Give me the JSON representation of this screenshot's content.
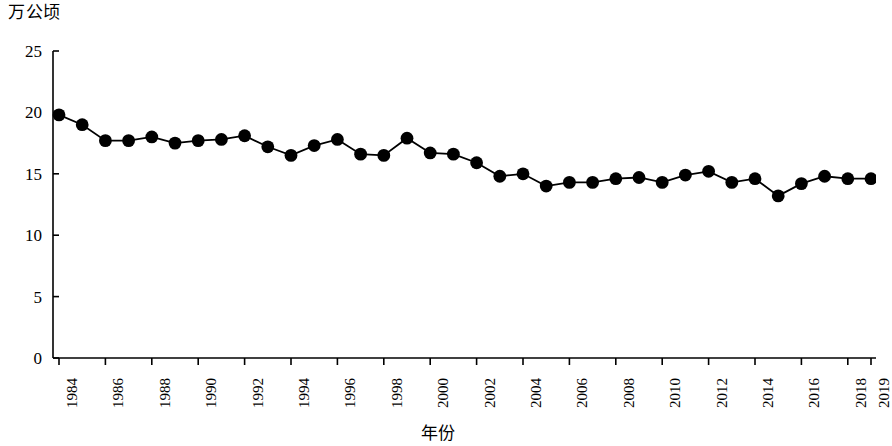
{
  "chart_data": {
    "type": "line",
    "title": "",
    "subtitle": "",
    "xlabel": "年份",
    "ylabel": "万公顷",
    "ylim": [
      0,
      25
    ],
    "yticks": [
      0,
      5,
      10,
      15,
      20,
      25
    ],
    "xlim": [
      1984,
      2019
    ],
    "grid": false,
    "legend": null,
    "marker": "filled-circle",
    "line_color": "#000000",
    "marker_color": "#000000",
    "x": [
      1984,
      1985,
      1986,
      1987,
      1988,
      1989,
      1990,
      1991,
      1992,
      1993,
      1994,
      1995,
      1996,
      1997,
      1998,
      1999,
      2000,
      2001,
      2002,
      2003,
      2004,
      2005,
      2006,
      2007,
      2008,
      2009,
      2010,
      2011,
      2012,
      2013,
      2014,
      2015,
      2016,
      2017,
      2018,
      2019
    ],
    "values": [
      19.8,
      19.0,
      17.7,
      17.7,
      18.0,
      17.5,
      17.7,
      17.8,
      18.1,
      17.2,
      16.5,
      17.3,
      17.8,
      16.6,
      16.5,
      17.9,
      16.7,
      16.6,
      15.9,
      14.8,
      15.0,
      14.0,
      14.3,
      14.3,
      14.6,
      14.7,
      14.3,
      14.9,
      15.2,
      14.3,
      14.6,
      13.2,
      14.2,
      14.8,
      14.6,
      14.6
    ],
    "xtick_labels": [
      "1984",
      "1986",
      "1988",
      "1990",
      "1992",
      "1994",
      "1996",
      "1998",
      "2000",
      "2002",
      "2004",
      "2006",
      "2008",
      "2010",
      "2012",
      "2014",
      "2016",
      "2018",
      "2019"
    ],
    "xtick_values": [
      1984,
      1986,
      1988,
      1990,
      1992,
      1994,
      1996,
      1998,
      2000,
      2002,
      2004,
      2006,
      2008,
      2010,
      2012,
      2014,
      2016,
      2018,
      2019
    ]
  }
}
